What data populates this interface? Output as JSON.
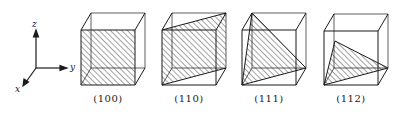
{
  "axes": {
    "z": "z",
    "y": "y",
    "x": "x"
  },
  "planes": [
    {
      "label": "(100)",
      "center_x": 108
    },
    {
      "label": "(110)",
      "center_x": 189
    },
    {
      "label": "(111)",
      "center_x": 269
    },
    {
      "label": "(112)",
      "center_x": 351
    }
  ],
  "colors": {
    "line": "#1a1a1a",
    "hatch": "#333333",
    "background": "#ffffff"
  }
}
